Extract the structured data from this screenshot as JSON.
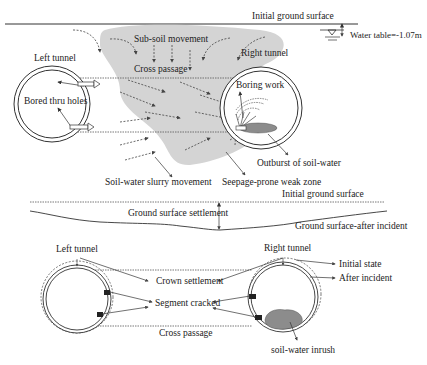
{
  "top_section": {
    "initial_ground_surface": "Initial ground surface",
    "water_table": "Water table=-1.07m",
    "left_tunnel": "Left tunnel",
    "right_tunnel": "Right tunnel",
    "sub_soil_movement": "Sub-soil movement",
    "cross_passage": "Cross passage",
    "bored_thru_holes": "Bored thru holes",
    "boring_work": "Boring work",
    "outburst": "Outburst of soil-water",
    "slurry_movement": "Soil-water slurry movement",
    "weak_zone": "Seepage-prone weak zone"
  },
  "middle_section": {
    "initial_ground_surface": "Initial ground surface",
    "settlement": "Ground surface settlement",
    "after_incident": "Ground surface-after incident"
  },
  "bottom_section": {
    "left_tunnel": "Left tunnel",
    "right_tunnel": "Right tunnel",
    "crown_settlement": "Crown settlement",
    "segment_cracked": "Segment cracked",
    "cross_passage": "Cross passage",
    "initial_state": "Initial state",
    "after_incident": "After incident",
    "inrush": "soil-water inrush"
  },
  "colors": {
    "zone_fill": "#d4d4d4",
    "line": "#333333",
    "inrush_fill": "#8c8c8c"
  }
}
